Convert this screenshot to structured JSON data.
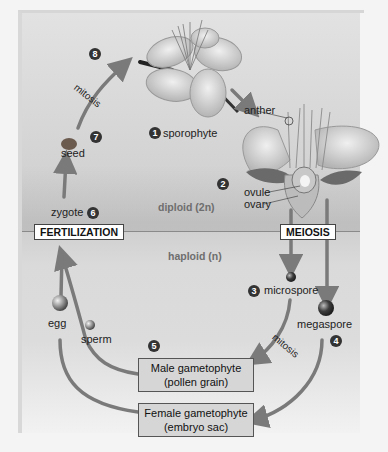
{
  "diagram": {
    "zones": {
      "diploid": "diploid (2n)",
      "haploid": "haploid (n)"
    },
    "process_tags": {
      "fertilization": "FERTILIZATION",
      "meiosis": "MEIOSIS"
    },
    "labels": {
      "sporophyte": "sporophyte",
      "anther": "anther",
      "ovule": "ovule",
      "ovary": "ovary",
      "microspore": "microspore",
      "megaspore": "megaspore",
      "egg": "egg",
      "sperm": "sperm",
      "zygote": "zygote",
      "seed": "seed",
      "mitosis_top": "mitosis",
      "mitosis_right": "mitosis"
    },
    "boxes": {
      "male_line1": "Male gametophyte",
      "male_line2": "(pollen grain)",
      "female_line1": "Female gametophyte",
      "female_line2": "(embryo sac)"
    },
    "steps": [
      "1",
      "2",
      "3",
      "4",
      "5",
      "6",
      "7",
      "8"
    ],
    "colors": {
      "arrow": "#7a7a7a",
      "box_fill": "#d6d6d6",
      "step_badge": "#333333"
    }
  }
}
